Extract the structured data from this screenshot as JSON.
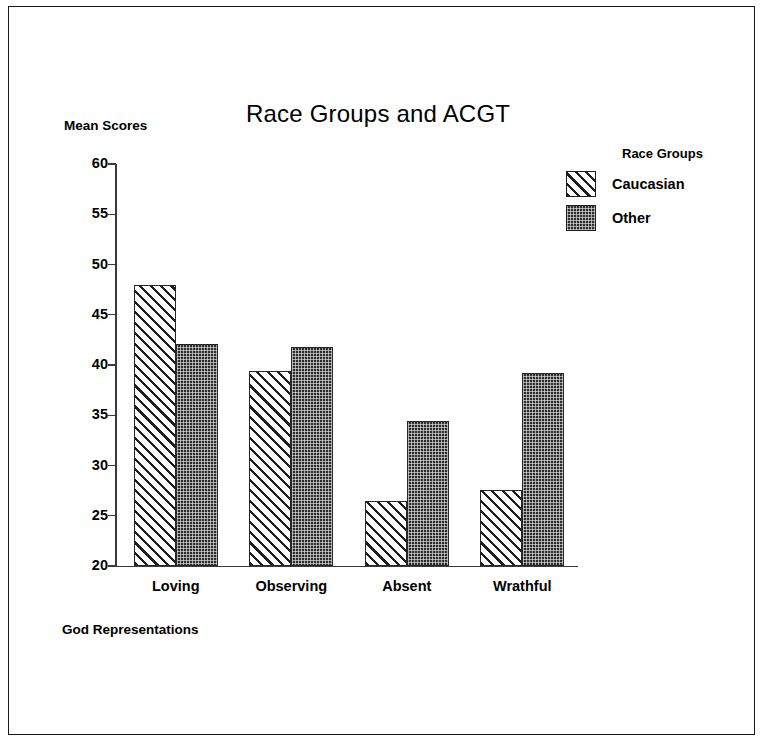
{
  "chart_data": {
    "type": "bar",
    "title": "Race Groups and ACGT",
    "xlabel": "God Representations",
    "ylabel": "Mean Scores",
    "categories": [
      "Loving",
      "Observing",
      "Absent",
      "Wrathful"
    ],
    "series": [
      {
        "name": "Caucasian",
        "fill": "diagonal-hatch",
        "values": [
          48.0,
          39.4,
          26.5,
          27.6
        ]
      },
      {
        "name": "Other",
        "fill": "dark-dotted",
        "values": [
          42.1,
          41.8,
          34.4,
          39.2
        ]
      }
    ],
    "ylim": [
      20,
      60
    ],
    "yticks": [
      20,
      25,
      30,
      35,
      40,
      45,
      50,
      55,
      60
    ],
    "ytick_labels": [
      "20",
      "25",
      "30",
      "35",
      "40",
      "45",
      "50",
      "55",
      "60"
    ],
    "grid": false,
    "legend": {
      "title": "Race Groups",
      "position": "top-right",
      "entries": [
        "Caucasian",
        "Other"
      ]
    },
    "colors": {
      "bar_outline": "#262626",
      "hatch_line": "#1d1d1d",
      "dotted_fill": "#2e2e2e",
      "axis": "#3a3a3a",
      "background": "#ffffff",
      "frame": "#1a1a1a"
    }
  }
}
